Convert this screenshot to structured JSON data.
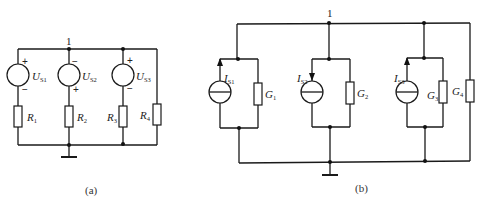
{
  "figure_a": {
    "caption": "(a)",
    "node_label": "1",
    "sources": [
      {
        "symbol": "U",
        "sub": "S1",
        "top_sign": "+",
        "bottom_sign": "−"
      },
      {
        "symbol": "U",
        "sub": "S2",
        "top_sign": "−",
        "bottom_sign": "+"
      },
      {
        "symbol": "U",
        "sub": "S3",
        "top_sign": "+",
        "bottom_sign": "−"
      }
    ],
    "resistors": [
      {
        "symbol": "R",
        "sub": "1"
      },
      {
        "symbol": "R",
        "sub": "2"
      },
      {
        "symbol": "R",
        "sub": "3"
      },
      {
        "symbol": "R",
        "sub": "4"
      }
    ]
  },
  "figure_b": {
    "caption": "(b)",
    "node_label": "1",
    "current_sources": [
      {
        "symbol": "I",
        "sub": "S1",
        "arrow": "up"
      },
      {
        "symbol": "I",
        "sub": "S2",
        "arrow": "down"
      },
      {
        "symbol": "I",
        "sub": "S3",
        "arrow": "up"
      }
    ],
    "conductances": [
      {
        "symbol": "G",
        "sub": "1"
      },
      {
        "symbol": "G",
        "sub": "2"
      },
      {
        "symbol": "G",
        "sub": "3"
      },
      {
        "symbol": "G",
        "sub": "4"
      }
    ]
  }
}
